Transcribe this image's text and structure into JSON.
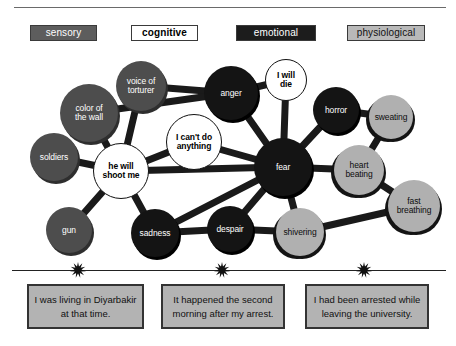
{
  "legend": {
    "items": [
      {
        "key": "sensory",
        "label": "sensory"
      },
      {
        "key": "cognitive",
        "label": "cognitive"
      },
      {
        "key": "emotional",
        "label": "emotional"
      },
      {
        "key": "physiological",
        "label": "physiological"
      }
    ]
  },
  "colors": {
    "sensory_fill": "#4d4d4d",
    "sensory_text": "#ffffff",
    "cognitive_fill": "#ffffff",
    "cognitive_text": "#000000",
    "emotional_fill": "#141414",
    "emotional_text": "#ffffff",
    "physiological_fill": "#b0b0b0",
    "physiological_text": "#0d0d0d",
    "edge": "#1a1a1a",
    "caption_fill": "#b3b3b3",
    "caption_border": "#333333"
  },
  "graph": {
    "nodes": [
      {
        "id": "color_of_the_wall",
        "label": "color of\nthe wall",
        "category": "sensory",
        "cx": 89,
        "cy": 113,
        "r": 29
      },
      {
        "id": "voice_of_torturer",
        "label": "voice of\ntorturer",
        "category": "sensory",
        "cx": 141,
        "cy": 86,
        "r": 25
      },
      {
        "id": "soldiers",
        "label": "soldiers",
        "category": "sensory",
        "cx": 54,
        "cy": 157,
        "r": 24
      },
      {
        "id": "gun",
        "label": "gun",
        "category": "sensory",
        "cx": 69,
        "cy": 230,
        "r": 23
      },
      {
        "id": "he_will_shoot_me",
        "label": "he will\nshoot me",
        "category": "cognitive",
        "cx": 121,
        "cy": 171,
        "r": 28
      },
      {
        "id": "i_cant_do_anything",
        "label": "I can't do\nanything",
        "category": "cognitive",
        "cx": 194,
        "cy": 142,
        "r": 28
      },
      {
        "id": "i_will_die",
        "label": "I will\ndie",
        "category": "cognitive",
        "cx": 286,
        "cy": 80,
        "r": 21
      },
      {
        "id": "anger",
        "label": "anger",
        "category": "emotional",
        "cx": 231,
        "cy": 93,
        "r": 27
      },
      {
        "id": "fear",
        "label": "fear",
        "category": "emotional",
        "cx": 283,
        "cy": 167,
        "r": 29
      },
      {
        "id": "horror",
        "label": "horror",
        "category": "emotional",
        "cx": 336,
        "cy": 110,
        "r": 23
      },
      {
        "id": "sadness",
        "label": "sadness",
        "category": "emotional",
        "cx": 155,
        "cy": 233,
        "r": 24
      },
      {
        "id": "despair",
        "label": "despair",
        "category": "emotional",
        "cx": 230,
        "cy": 229,
        "r": 23
      },
      {
        "id": "sweating",
        "label": "sweating",
        "category": "physiological",
        "cx": 391,
        "cy": 117,
        "r": 22
      },
      {
        "id": "heart_beating",
        "label": "heart\nbeating",
        "category": "physiological",
        "cx": 359,
        "cy": 170,
        "r": 25
      },
      {
        "id": "fast_breathing",
        "label": "fast\nbreathing",
        "category": "physiological",
        "cx": 414,
        "cy": 206,
        "r": 26
      },
      {
        "id": "shivering",
        "label": "shivering",
        "category": "physiological",
        "cx": 300,
        "cy": 232,
        "r": 24
      }
    ],
    "edges": [
      [
        "color_of_the_wall",
        "he_will_shoot_me"
      ],
      [
        "voice_of_torturer",
        "he_will_shoot_me"
      ],
      [
        "soldiers",
        "he_will_shoot_me"
      ],
      [
        "gun",
        "he_will_shoot_me"
      ],
      [
        "he_will_shoot_me",
        "sadness"
      ],
      [
        "he_will_shoot_me",
        "i_cant_do_anything"
      ],
      [
        "he_will_shoot_me",
        "fear"
      ],
      [
        "voice_of_torturer",
        "anger"
      ],
      [
        "color_of_the_wall",
        "anger"
      ],
      [
        "i_cant_do_anything",
        "fear"
      ],
      [
        "anger",
        "fear"
      ],
      [
        "anger",
        "i_will_die"
      ],
      [
        "i_will_die",
        "fear"
      ],
      [
        "horror",
        "fear"
      ],
      [
        "fear",
        "heart_beating"
      ],
      [
        "fear",
        "despair"
      ],
      [
        "fear",
        "shivering"
      ],
      [
        "fear",
        "sadness"
      ],
      [
        "horror",
        "sweating"
      ],
      [
        "heart_beating",
        "sweating"
      ],
      [
        "heart_beating",
        "fast_breathing"
      ],
      [
        "shivering",
        "fast_breathing"
      ],
      [
        "despair",
        "shivering"
      ],
      [
        "sadness",
        "despair"
      ]
    ]
  },
  "timeline": {
    "markers": [
      {
        "x": 78
      },
      {
        "x": 222
      },
      {
        "x": 364
      }
    ],
    "captions": [
      {
        "id": "caption-1",
        "text": "I was living in Diyarbakir at that time."
      },
      {
        "id": "caption-2",
        "text": "It happened the second morning after my arrest."
      },
      {
        "id": "caption-3",
        "text": "I had been arrested while leaving the university."
      }
    ]
  }
}
